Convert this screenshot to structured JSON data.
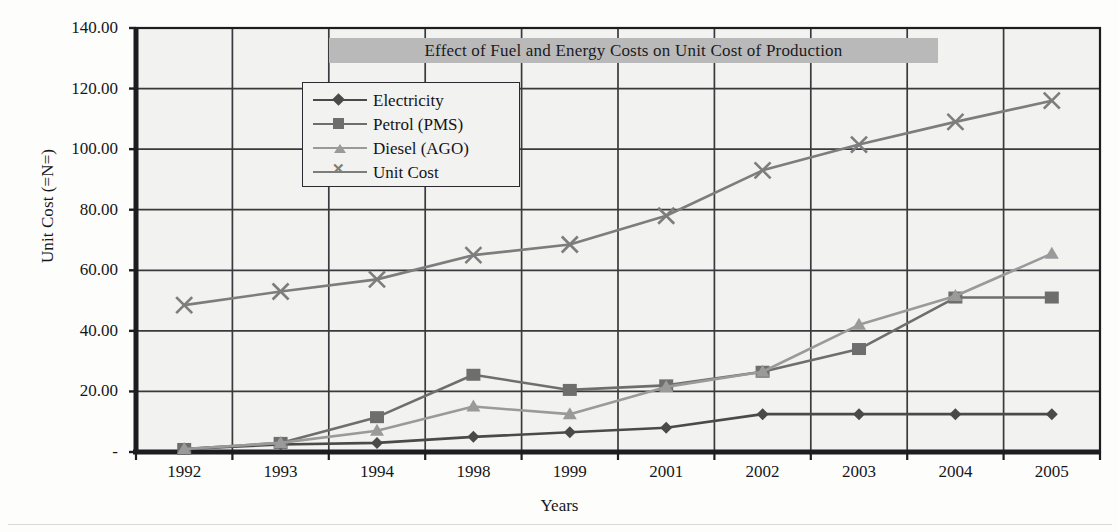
{
  "chart_data": {
    "type": "line",
    "title": "Effect of Fuel and Energy Costs on Unit Cost of Production",
    "xlabel": "Years",
    "ylabel": "Unit Cost (=N=)",
    "categories": [
      "1992",
      "1993",
      "1994",
      "1998",
      "1999",
      "2001",
      "2002",
      "2003",
      "2004",
      "2005"
    ],
    "ylim": [
      0,
      140
    ],
    "ytick_labels": [
      "140.00",
      "120.00",
      "100.00",
      "80.00",
      "60.00",
      "40.00",
      "20.00",
      "-"
    ],
    "ytick_values": [
      140,
      120,
      100,
      80,
      60,
      40,
      20,
      0
    ],
    "grid": true,
    "legend_position": "upper-left-inside",
    "series": [
      {
        "name": "Electricity",
        "marker": "diamond",
        "color": "#4a4a4a",
        "values": [
          1.0,
          2.5,
          3.0,
          5.0,
          6.5,
          8.0,
          12.5,
          12.5,
          12.5,
          12.5
        ]
      },
      {
        "name": "Petrol (PMS)",
        "marker": "square",
        "color": "#6e6e6e",
        "values": [
          1.0,
          3.0,
          11.5,
          25.5,
          20.5,
          22.0,
          26.5,
          34.0,
          51.0,
          51.0
        ]
      },
      {
        "name": "Diesel (AGO)",
        "marker": "triangle",
        "color": "#9a9a9a",
        "values": [
          1.0,
          3.0,
          7.0,
          15.0,
          12.5,
          21.5,
          26.5,
          42.0,
          51.5,
          65.5
        ]
      },
      {
        "name": "Unit Cost",
        "marker": "x",
        "color": "#7d7d7d",
        "values": [
          48.5,
          53.0,
          57.0,
          65.0,
          68.5,
          78.0,
          93.0,
          101.5,
          109.0,
          116.0
        ]
      }
    ]
  },
  "colors": {
    "title_band": "#b9b9b9",
    "plot_background": "#f2f2f0",
    "axis": "#1d1d20",
    "gridline": "#3a3a3e"
  }
}
